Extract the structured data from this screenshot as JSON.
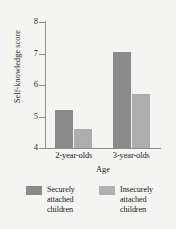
{
  "chart_data": {
    "type": "bar",
    "title": "",
    "subtitle": "",
    "xlabel": "Age",
    "ylabel": "Self-knowledge score",
    "categories": [
      "2-year-olds",
      "3-year-olds"
    ],
    "series": [
      {
        "name": "Securely attached children",
        "legend_lines": [
          "Securely",
          "attached",
          "children"
        ],
        "color": "#8a8a8a",
        "values": [
          5.2,
          7.05
        ]
      },
      {
        "name": "Insecurely attached children",
        "legend_lines": [
          "Insecurely",
          "attached",
          "children"
        ],
        "color": "#adadad",
        "values": [
          4.6,
          5.7
        ]
      }
    ],
    "ylim": [
      4,
      8
    ],
    "yticks": [
      8,
      7,
      6,
      5,
      4
    ],
    "ytick_labels": [
      "8",
      "7",
      "6",
      "5",
      "4"
    ],
    "grid": false,
    "legend_position": "bottom"
  },
  "figure": {
    "background_color": "#f4f4f2",
    "axis_color": "#8e8e8e",
    "text_color": "#1a1a1a"
  }
}
